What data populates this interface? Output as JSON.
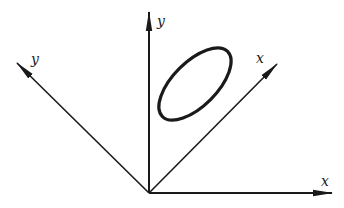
{
  "diagram": {
    "stroke_color": "#1a1a1a",
    "origin": {
      "x": 149,
      "y": 193
    },
    "axes": [
      {
        "id": "x-fixed",
        "label": "x",
        "end": {
          "x": 332,
          "y": 193
        },
        "label_pos": {
          "x": 321,
          "y": 186
        }
      },
      {
        "id": "y-fixed",
        "label": "y",
        "end": {
          "x": 149,
          "y": 12
        },
        "label_pos": {
          "x": 157,
          "y": 26
        }
      },
      {
        "id": "x-rotated",
        "label": "x",
        "end": {
          "x": 277,
          "y": 64
        },
        "label_pos": {
          "x": 256,
          "y": 63
        }
      },
      {
        "id": "y-rotated",
        "label": "y",
        "end": {
          "x": 17,
          "y": 63
        },
        "label_pos": {
          "x": 31,
          "y": 64
        }
      }
    ],
    "ellipse": {
      "cx": 195,
      "cy": 84,
      "rx": 46,
      "ry": 22,
      "rotation_deg": -45
    }
  }
}
